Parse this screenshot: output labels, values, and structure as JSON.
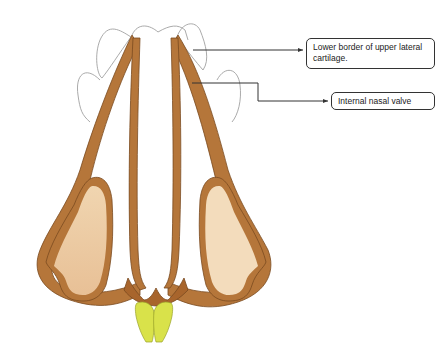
{
  "diagram": {
    "labels": [
      {
        "id": "upper-lateral-cartilage",
        "text": "Lower border of upper lateral cartilage."
      },
      {
        "id": "internal-nasal-valve",
        "text": "Internal nasal valve"
      }
    ],
    "colors": {
      "cartilage_outline": "#b5763a",
      "cartilage_fill_dark": "#a8652c",
      "lobule_fill": "#eccb9f",
      "lobule_fill_light": "#f3dcbc",
      "columella_base": "#d9e24a",
      "sketch_outline": "#9a9a9a",
      "leader_line": "#333333"
    }
  }
}
